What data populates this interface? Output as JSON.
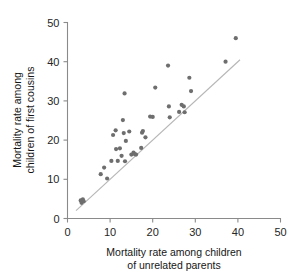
{
  "chart_data": {
    "type": "scatter",
    "title": "",
    "xlabel": "Mortality rate among children of unrelated parents",
    "xlabel_line1": "Mortality rate among children",
    "xlabel_line2": "of unrelated parents",
    "ylabel": "Mortality rate among children of first cousins",
    "ylabel_line1": "Mortality rate among",
    "ylabel_line2": "children of first cousins",
    "xlim": [
      0,
      50
    ],
    "ylim": [
      0,
      50
    ],
    "xticks": [
      0,
      10,
      20,
      30,
      40,
      50
    ],
    "yticks": [
      0,
      10,
      20,
      30,
      40,
      50
    ],
    "xtick_labels": [
      "0",
      "10",
      "20",
      "30",
      "40",
      "50"
    ],
    "ytick_labels": [
      "0",
      "10",
      "20",
      "30",
      "40",
      "50"
    ],
    "grid": false,
    "legend": false,
    "point_color": "#6e6e6e",
    "point_radius": 2.1,
    "reference_line": {
      "type": "identity",
      "label": "y = x",
      "color": "#b6b6b6",
      "x_start": 2.0,
      "y_start": 2.0,
      "x_end": 40.5,
      "y_end": 40.5
    },
    "points": [
      [
        3.1,
        4.6
      ],
      [
        3.3,
        4.0
      ],
      [
        3.6,
        4.9
      ],
      [
        3.8,
        4.4
      ],
      [
        7.8,
        11.3
      ],
      [
        8.6,
        13.0
      ],
      [
        9.3,
        10.2
      ],
      [
        10.3,
        14.7
      ],
      [
        10.7,
        21.3
      ],
      [
        11.3,
        22.5
      ],
      [
        11.4,
        17.7
      ],
      [
        11.8,
        14.7
      ],
      [
        12.3,
        17.9
      ],
      [
        12.7,
        16.0
      ],
      [
        13.0,
        25.1
      ],
      [
        13.2,
        21.8
      ],
      [
        13.4,
        31.9
      ],
      [
        13.5,
        14.6
      ],
      [
        13.7,
        19.8
      ],
      [
        14.5,
        22.2
      ],
      [
        15.0,
        16.3
      ],
      [
        15.5,
        16.8
      ],
      [
        15.8,
        16.4
      ],
      [
        16.1,
        16.3
      ],
      [
        17.3,
        18.0
      ],
      [
        17.5,
        21.9
      ],
      [
        17.7,
        22.3
      ],
      [
        18.3,
        20.7
      ],
      [
        19.4,
        26.0
      ],
      [
        20.0,
        25.9
      ],
      [
        20.6,
        33.4
      ],
      [
        23.6,
        39.0
      ],
      [
        23.8,
        28.6
      ],
      [
        24.0,
        25.8
      ],
      [
        26.2,
        27.2
      ],
      [
        26.8,
        29.0
      ],
      [
        27.3,
        28.6
      ],
      [
        27.5,
        27.1
      ],
      [
        28.6,
        35.9
      ],
      [
        29.0,
        32.5
      ],
      [
        37.1,
        40.0
      ],
      [
        39.5,
        46.0
      ]
    ]
  }
}
